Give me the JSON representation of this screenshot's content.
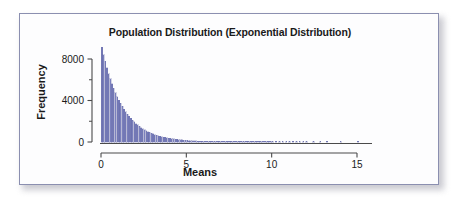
{
  "figure": {
    "name": "population-distribution-histogram",
    "background_color": "#fdfdfe",
    "border_color": "#8b8fb0",
    "bar_color": "#7b80bd",
    "bar_edge_color": "#5b5fa0",
    "axis_color": "#4a4a4a",
    "text_color": "#1a1a1a"
  },
  "chart_data": {
    "type": "bar",
    "title": "Population Distribution (Exponential Distribution)",
    "subtitle": "",
    "xlabel": "Means",
    "ylabel": "Frequency",
    "grid": false,
    "legend": null,
    "xlim": [
      0,
      16.4
    ],
    "ylim": [
      0,
      9600
    ],
    "xticks": [
      0,
      5,
      10,
      15
    ],
    "xticklabels": [
      "0",
      "5",
      "10",
      "15"
    ],
    "yticks": [
      0,
      4000,
      8000
    ],
    "yticklabels": [
      "0",
      "4000",
      "8000"
    ],
    "yminorticks": [
      2000,
      6000
    ],
    "bin_width": 0.1,
    "x": [
      0.05,
      0.15,
      0.25,
      0.35,
      0.45,
      0.55,
      0.65,
      0.75,
      0.85,
      0.95,
      1.05,
      1.15,
      1.25,
      1.35,
      1.45,
      1.55,
      1.65,
      1.75,
      1.85,
      1.95,
      2.05,
      2.15,
      2.25,
      2.35,
      2.45,
      2.55,
      2.65,
      2.75,
      2.85,
      2.95,
      3.05,
      3.15,
      3.25,
      3.35,
      3.45,
      3.55,
      3.65,
      3.75,
      3.85,
      3.95,
      4.05,
      4.15,
      4.25,
      4.35,
      4.45,
      4.55,
      4.65,
      4.75,
      4.85,
      4.95,
      5.05,
      5.15,
      5.25,
      5.35,
      5.45,
      5.55,
      5.65,
      5.75,
      5.85,
      5.95,
      6.05,
      6.15,
      6.25,
      6.35,
      6.45,
      6.55,
      6.65,
      6.75,
      6.85,
      6.95,
      7.05,
      7.15,
      7.25,
      7.35,
      7.45,
      7.55,
      7.65,
      7.75,
      7.85,
      7.95,
      8.05,
      8.15,
      8.25,
      8.35,
      8.45,
      8.55,
      8.65,
      8.75,
      8.85,
      8.95,
      9.05,
      9.15,
      9.25,
      9.35,
      9.45,
      9.55,
      9.65,
      9.75,
      9.85,
      9.95,
      10.05,
      10.25,
      10.45,
      10.65,
      10.85,
      11.05,
      11.25,
      11.45,
      11.65,
      11.85,
      12.05,
      12.45,
      12.85,
      13.25,
      14.05,
      15.05
    ],
    "values": [
      9150,
      8420,
      7760,
      7150,
      6600,
      6080,
      5600,
      5160,
      4760,
      4380,
      4040,
      3720,
      3430,
      3160,
      2910,
      2680,
      2470,
      2280,
      2100,
      1930,
      1780,
      1640,
      1510,
      1390,
      1280,
      1180,
      1090,
      1000,
      925,
      850,
      785,
      720,
      665,
      610,
      565,
      520,
      480,
      440,
      405,
      375,
      345,
      318,
      293,
      270,
      248,
      229,
      211,
      194,
      179,
      165,
      152,
      140,
      129,
      118,
      109,
      100,
      92,
      85,
      78,
      72,
      66,
      61,
      56,
      52,
      48,
      44,
      40,
      37,
      34,
      31,
      29,
      27,
      25,
      23,
      21,
      19,
      18,
      16,
      15,
      14,
      13,
      12,
      11,
      10,
      9,
      8,
      8,
      7,
      6,
      6,
      5,
      5,
      4,
      4,
      4,
      3,
      3,
      3,
      2,
      2,
      2,
      2,
      2,
      1,
      1,
      1,
      1,
      1,
      1,
      1,
      1,
      1,
      1,
      1,
      1,
      1
    ]
  }
}
